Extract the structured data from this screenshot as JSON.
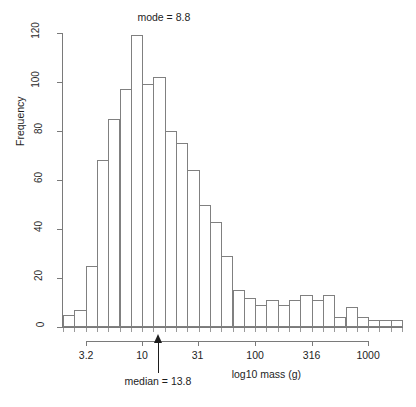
{
  "figure": {
    "title": "",
    "mode_annotation": "mode = 8.8",
    "median_annotation": "median = 13.8",
    "caption": ""
  },
  "axes": {
    "ylabel": "Frequency",
    "xlabel": "log10 mass (g)",
    "y_ticks": [
      "0",
      "20",
      "40",
      "60",
      "80",
      "100",
      "120"
    ],
    "x_ticks": [
      "3.2",
      "10",
      "31",
      "100",
      "316",
      "1000"
    ]
  },
  "chart_data": {
    "type": "bar",
    "title": "",
    "xlabel": "log10 mass (g)",
    "ylabel": "Frequency",
    "ylim": [
      0,
      120
    ],
    "xlim_log10": [
      0.3,
      3.25
    ],
    "grid": false,
    "legend": null,
    "bin_width_log10": 0.1,
    "annotations": [
      {
        "text": "mode = 8.8",
        "x_value": 8.8,
        "position": "top"
      },
      {
        "text": "median = 13.8",
        "x_value": 13.8,
        "position": "bottom",
        "marker": "up-arrow"
      }
    ],
    "x_tick_values": [
      3.2,
      10,
      31,
      100,
      316,
      1000
    ],
    "x_tick_labels": [
      "3.2",
      "10",
      "31",
      "100",
      "316",
      "1000"
    ],
    "y_tick_values": [
      0,
      20,
      40,
      60,
      80,
      100,
      120
    ],
    "categories": [
      "0.30-0.40",
      "0.40-0.50",
      "0.50-0.60",
      "0.60-0.70",
      "0.70-0.80",
      "0.80-0.90",
      "0.90-1.00",
      "1.00-1.10",
      "1.10-1.20",
      "1.20-1.30",
      "1.30-1.40",
      "1.40-1.50",
      "1.50-1.60",
      "1.60-1.70",
      "1.70-1.80",
      "1.80-1.90",
      "1.90-2.00",
      "2.00-2.10",
      "2.10-2.20",
      "2.20-2.30",
      "2.30-2.40",
      "2.40-2.50",
      "2.50-2.60",
      "2.60-2.70",
      "2.70-2.80",
      "2.80-2.90",
      "2.90-3.00",
      "3.00-3.10",
      "3.10-3.20",
      "3.20-3.30"
    ],
    "values": [
      5,
      7,
      25,
      68,
      85,
      97,
      119,
      99,
      102,
      80,
      75,
      64,
      50,
      43,
      29,
      15,
      12,
      9,
      11,
      9,
      11,
      13,
      11,
      13,
      4,
      8,
      4,
      3,
      3,
      3
    ]
  }
}
